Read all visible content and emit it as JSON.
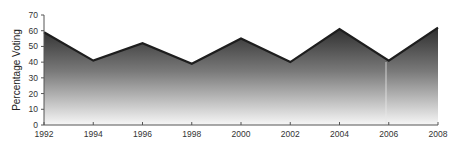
{
  "chart_data": {
    "type": "area",
    "title": "",
    "xlabel": "",
    "ylabel": "Percentage Voting",
    "x": [
      1992,
      1994,
      1996,
      1998,
      2000,
      2002,
      2004,
      2006,
      2008
    ],
    "x_tick_labels": [
      "1992",
      "1994",
      "1996",
      "1998",
      "2000",
      "2002",
      "2004",
      "2006",
      "2008"
    ],
    "y_ticks": [
      0,
      10,
      20,
      30,
      40,
      50,
      60,
      70
    ],
    "y_tick_labels": [
      "0",
      "10",
      "20",
      "30",
      "40",
      "50",
      "60",
      "70"
    ],
    "series": [
      {
        "name": "Percentage Voting",
        "values": [
          59,
          41,
          52,
          39,
          55,
          40,
          61,
          41,
          62
        ]
      }
    ],
    "ylim": [
      0,
      70
    ],
    "xlim": [
      1992,
      2008
    ],
    "grid": false,
    "legend": "none",
    "colors": {
      "fill_top": "#2e2e2e",
      "fill_bottom": "#f7f7f7",
      "line": "#1e1e1e",
      "axis": "#555555"
    }
  }
}
